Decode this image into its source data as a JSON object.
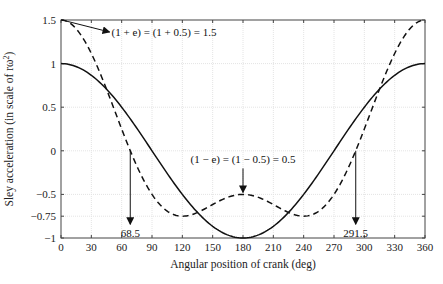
{
  "chart_data": {
    "type": "line",
    "title": "",
    "xlabel": "Angular position of crank (deg)",
    "ylabel": "Sley acceleration (in scale of rω²)",
    "xlim": [
      0,
      360
    ],
    "ylim": [
      -1,
      1.5
    ],
    "grid": true,
    "x_ticks": [
      0,
      30,
      60,
      90,
      120,
      150,
      180,
      210,
      240,
      270,
      300,
      330,
      360
    ],
    "x_tick_labels": [
      "0",
      "30",
      "60",
      "90",
      "120",
      "150",
      "180",
      "210",
      "240",
      "270",
      "300",
      "330",
      "360"
    ],
    "y_ticks": [
      -1,
      -0.75,
      -0.5,
      0,
      0.5,
      1,
      1.5
    ],
    "y_tick_labels": [
      "−1",
      "−0.75",
      "−0.5",
      "0",
      "0.5",
      "1",
      "1.5"
    ],
    "series": [
      {
        "name": "cos θ (solid)",
        "style": "solid",
        "x": [
          0,
          30,
          60,
          90,
          120,
          150,
          180,
          210,
          240,
          270,
          300,
          330,
          360
        ],
        "values": [
          1,
          0.866,
          0.5,
          0,
          -0.5,
          -0.866,
          -1,
          -0.866,
          -0.5,
          0,
          0.5,
          0.866,
          1
        ]
      },
      {
        "name": "cos θ + e·cos 2θ, e = 0.5 (dashed)",
        "style": "dashed",
        "x": [
          0,
          30,
          60,
          68.5,
          90,
          120,
          150,
          180,
          210,
          240,
          270,
          291.5,
          300,
          330,
          360
        ],
        "values": [
          1.5,
          1.116,
          0.25,
          0,
          -0.5,
          -0.75,
          -0.616,
          -0.5,
          -0.616,
          -0.75,
          -0.5,
          0,
          0.25,
          1.116,
          1.5
        ]
      }
    ],
    "annotations": [
      {
        "text": "(1 + e) = (1 + 0.5) = 1.5",
        "points_to": [
          0,
          1.5
        ]
      },
      {
        "text": "(1 − e) = (1 − 0.5) = 0.5",
        "points_to": [
          180,
          -0.5
        ]
      },
      {
        "text": "68.5",
        "points_to": [
          68.5,
          -0.75
        ]
      },
      {
        "text": "291.5",
        "points_to": [
          291.5,
          -0.75
        ]
      }
    ]
  }
}
